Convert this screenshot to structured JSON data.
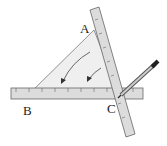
{
  "diagram": {
    "type": "geometry-construction",
    "labels": {
      "a": "A",
      "b": "B",
      "c": "C"
    },
    "colors": {
      "triangle_fill": "#eeeeee",
      "ruler_fill": "#d9d9d9",
      "outline": "#555555",
      "pencil": "#444444"
    }
  }
}
